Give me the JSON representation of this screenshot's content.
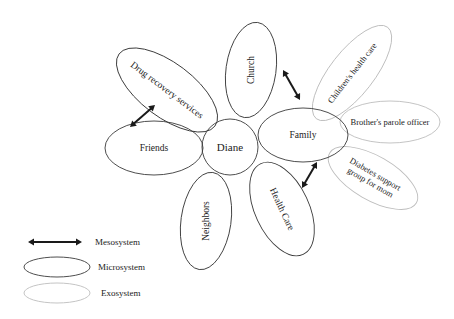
{
  "center": {
    "label": "Diane",
    "cx": 230,
    "cy": 147,
    "r": 28
  },
  "microsystems": [
    {
      "id": "drug-recovery-services",
      "label": "Drug recovery services",
      "cx": 167,
      "cy": 90,
      "rx": 60,
      "ry": 27,
      "rotate": 37,
      "font": 9.5
    },
    {
      "id": "friends",
      "label": "Friends",
      "cx": 154,
      "cy": 148,
      "rx": 49,
      "ry": 27,
      "rotate": 0,
      "font": 9.5
    },
    {
      "id": "church",
      "label": "Church",
      "cx": 251,
      "cy": 70,
      "rx": 25,
      "ry": 48,
      "rotate": 8,
      "textRotate": -90,
      "font": 9.5
    },
    {
      "id": "family",
      "label": "Family",
      "cx": 303,
      "cy": 135,
      "rx": 45,
      "ry": 27,
      "rotate": 0,
      "font": 9.5
    },
    {
      "id": "neighbors",
      "label": "Neighbors",
      "cx": 206,
      "cy": 221,
      "rx": 25,
      "ry": 49,
      "rotate": 8,
      "textRotate": -90,
      "font": 9.5
    },
    {
      "id": "health-care",
      "label": "Health Care",
      "cx": 282,
      "cy": 209,
      "rx": 27,
      "ry": 50,
      "rotate": -25,
      "textRotate": 65,
      "font": 9.5
    }
  ],
  "exosystems": [
    {
      "id": "childrens-health-care",
      "label": "Children's health care",
      "cx": 352,
      "cy": 73,
      "rx": 58,
      "ry": 22,
      "rotate": -52,
      "font": 8.5
    },
    {
      "id": "brothers-parole-officer",
      "label": "Brother's parole officer",
      "cx": 390,
      "cy": 122,
      "rx": 50,
      "ry": 21,
      "rotate": 0,
      "font": 8.5
    },
    {
      "id": "diabetes-support-group",
      "label": "Diabetes support",
      "label2": "group for mom",
      "cx": 373,
      "cy": 178,
      "rx": 50,
      "ry": 22,
      "rotate": 30,
      "font": 8.5
    }
  ],
  "mesosystem_arrows": [
    {
      "id": "drug-recovery-to-friends",
      "x1": 155,
      "y1": 105,
      "x2": 130,
      "y2": 127
    },
    {
      "id": "church-to-family",
      "x1": 283,
      "y1": 70,
      "x2": 300,
      "y2": 100
    },
    {
      "id": "family-to-health-care",
      "x1": 317,
      "y1": 162,
      "x2": 302,
      "y2": 188
    }
  ],
  "legend": {
    "mesosystem": {
      "label": "Mesosystem",
      "x1": 28,
      "x2": 82,
      "y": 242,
      "tx": 95
    },
    "microsystem": {
      "label": "Microsystem",
      "cx": 57,
      "cy": 267,
      "rx": 33,
      "ry": 10,
      "tx": 98
    },
    "exosystem": {
      "label": "Exosystem",
      "cx": 57,
      "cy": 293,
      "rx": 33,
      "ry": 10,
      "tx": 101
    }
  },
  "colors": {
    "microsystem_stroke": "#3a3a3a",
    "exosystem_stroke": "#bdbdbd",
    "arrow": "#1a1a1a"
  }
}
